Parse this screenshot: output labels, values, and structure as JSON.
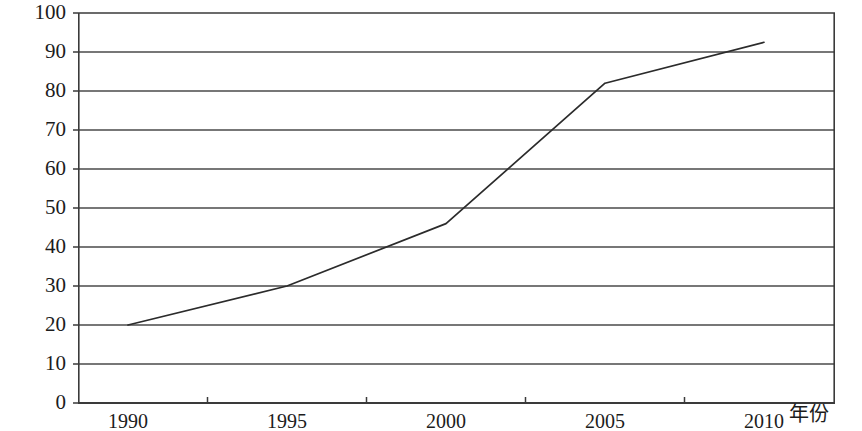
{
  "chart_data": {
    "type": "line",
    "title": "",
    "subtitle": "",
    "xlabel": "年份",
    "ylabel": "",
    "categories": [
      "1990",
      "1995",
      "2000",
      "2005",
      "2010"
    ],
    "series": [
      {
        "name": "",
        "values": [
          20,
          30,
          46,
          82,
          92.5
        ]
      }
    ],
    "ylim": [
      0,
      100
    ],
    "ytick_labels": [
      "0",
      "10",
      "20",
      "30",
      "40",
      "50",
      "60",
      "70",
      "80",
      "90",
      "100"
    ],
    "ytick_values": [
      0,
      10,
      20,
      30,
      40,
      50,
      60,
      70,
      80,
      90,
      100
    ],
    "grid": {
      "horizontal": true,
      "vertical": false
    },
    "legend": {
      "visible": false,
      "position": "none",
      "entries": []
    },
    "markers": false,
    "line_color": "#2b2b2b",
    "grid_color": "#4a4a4a",
    "axis_color": "#3a3a3a",
    "background_color": "#ffffff",
    "annotations": []
  }
}
